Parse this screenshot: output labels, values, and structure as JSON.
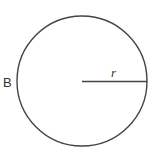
{
  "diagram": {
    "type": "circle-with-radius",
    "circle_label": "B",
    "radius_label": "r",
    "stroke_color": "#444444",
    "center": [
      82,
      81
    ],
    "radius": 65
  }
}
